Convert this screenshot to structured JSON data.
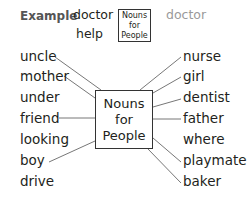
{
  "example": {
    "label": "Example",
    "words": [
      "doctor",
      "help"
    ],
    "box_lines": [
      "Nouns",
      "for",
      "People"
    ],
    "answer": "doctor"
  },
  "center_box": {
    "lines": [
      "Nouns",
      "for",
      "People"
    ]
  },
  "left_words": [
    "uncle",
    "mother",
    "under",
    "friend",
    "looking",
    "boy",
    "drive"
  ],
  "right_words": [
    "nurse",
    "girl",
    "dentist",
    "father",
    "where",
    "playmate",
    "baker"
  ],
  "connected": {
    "left": [
      "uncle",
      "mother",
      "friend",
      "boy"
    ],
    "right": [
      "nurse",
      "girl",
      "dentist",
      "father",
      "playmate",
      "baker"
    ]
  },
  "colors": {
    "text": "#231f20",
    "answer_gray": "#9a9a9a",
    "line": "#777777"
  }
}
